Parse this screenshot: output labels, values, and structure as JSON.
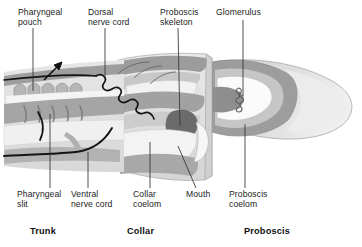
{
  "figure": {
    "background": "#ffffff",
    "line_color": "#1a1a1a"
  },
  "palette": {
    "outer_wall": "#9a9a9a",
    "mid_wall": "#b4b4b4",
    "inner_tissue": "#c9c9c9",
    "cavity_light": "#eeeeee",
    "cavity_lighter": "#f7f7f7",
    "proboscis_body": "#dcdcdc",
    "proboscis_tip": "#e8e8e8",
    "skeleton_dark": "#6e6e6e",
    "nerve": "#141414",
    "leader": "#333333"
  },
  "labels": {
    "top": [
      {
        "id": "pharyngeal-pouch",
        "text": "Pharyngeal\npouch",
        "x": 18,
        "y": 8
      },
      {
        "id": "dorsal-nerve-cord",
        "text": "Dorsal\nnerve cord",
        "x": 88,
        "y": 8
      },
      {
        "id": "proboscis-skeleton",
        "text": "Proboscis\nskeleton",
        "x": 160,
        "y": 8
      },
      {
        "id": "glomerulus",
        "text": "Glomerulus",
        "x": 216,
        "y": 8
      }
    ],
    "bottom": [
      {
        "id": "pharyngeal-slit",
        "text": "Pharyngeal\nslit",
        "x": 17,
        "y": 190
      },
      {
        "id": "ventral-nerve-cord",
        "text": "Ventral\nnerve cord",
        "x": 71,
        "y": 190
      },
      {
        "id": "collar-coelom",
        "text": "Collar\ncoelom",
        "x": 133,
        "y": 190
      },
      {
        "id": "mouth",
        "text": "Mouth",
        "x": 186,
        "y": 190
      },
      {
        "id": "proboscis-coelom",
        "text": "Proboscis\ncoelom",
        "x": 229,
        "y": 190
      }
    ],
    "regions": [
      {
        "id": "region-trunk",
        "text": "Trunk",
        "x": 30,
        "y": 226
      },
      {
        "id": "region-collar",
        "text": "Collar",
        "x": 127,
        "y": 226
      },
      {
        "id": "region-proboscis",
        "text": "Proboscis",
        "x": 244,
        "y": 226
      }
    ]
  },
  "annotations": {
    "water_flow_arrow": "up-right arrow above pharyngeal pouches",
    "glomerulus_shape": "small coiled squiggle inside proboscis coelom",
    "nerve_cord_shape": "looped chain along dorsal surface"
  }
}
